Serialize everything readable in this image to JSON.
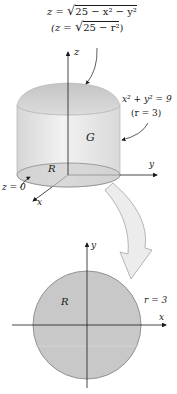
{
  "figure": {
    "top_formula": {
      "line1_prefix": "z = ",
      "line1_radicand": "25 − x² − y²",
      "line2_prefix": "(z = ",
      "line2_radicand": "25 − r²",
      "line2_suffix": ")"
    },
    "labels": {
      "z_axis": "z",
      "y_axis_3d": "y",
      "x_axis_3d": "x",
      "cylinder_eq": "x² + y² = 9",
      "cylinder_r": "(r = 3)",
      "solid": "G",
      "region_3d": "R",
      "base_plane": "z = 0",
      "y_axis_2d": "y",
      "x_axis_2d": "x",
      "region_2d": "R",
      "radius_2d": "r = 3"
    },
    "colors": {
      "dome_fill": "#cfcfcf",
      "cylinder_side": "#e6e6e6",
      "base_ellipse": "#d4d4d4",
      "disk_fill": "#c8c8c8",
      "disk_stroke": "#8a8a8a",
      "axis": "#1a1a1a",
      "big_arrow_fill": "#ececec",
      "big_arrow_stroke": "#9a9a9a"
    }
  }
}
